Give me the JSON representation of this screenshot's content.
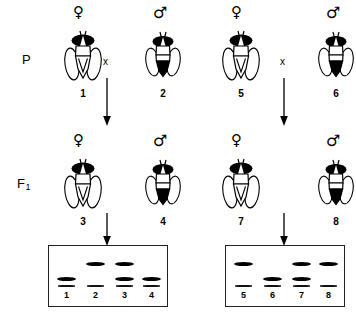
{
  "figure": {
    "type": "genetics-cross-diagram",
    "organism": "fruit fly"
  },
  "generations": [
    {
      "key": "P",
      "label": "P",
      "sub": ""
    },
    {
      "key": "F1",
      "label": "F",
      "sub": "1"
    }
  ],
  "cross_symbol": "x",
  "symbols": {
    "female": "♀",
    "male": "♂"
  },
  "crosses": [
    {
      "id": "cross-left",
      "parents": [
        {
          "number": "1",
          "sex": "female",
          "abdomen": "light"
        },
        {
          "number": "2",
          "sex": "male",
          "abdomen": "dark"
        }
      ],
      "offspring": [
        {
          "number": "3",
          "sex": "female",
          "abdomen": "light"
        },
        {
          "number": "4",
          "sex": "male",
          "abdomen": "dark"
        }
      ]
    },
    {
      "id": "cross-right",
      "parents": [
        {
          "number": "5",
          "sex": "female",
          "abdomen": "light"
        },
        {
          "number": "6",
          "sex": "male",
          "abdomen": "dark"
        }
      ],
      "offspring": [
        {
          "number": "7",
          "sex": "female",
          "abdomen": "light"
        },
        {
          "number": "8",
          "sex": "male",
          "abdomen": "dark"
        }
      ]
    }
  ],
  "gels": [
    {
      "id": "gel-left",
      "lanes": [
        {
          "label": "1",
          "bands": [
            {
              "position": "lower",
              "intensity": "strong"
            },
            {
              "position": "origin",
              "intensity": "faint"
            }
          ]
        },
        {
          "label": "2",
          "bands": [
            {
              "position": "upper",
              "intensity": "strong"
            },
            {
              "position": "origin",
              "intensity": "faint"
            }
          ]
        },
        {
          "label": "3",
          "bands": [
            {
              "position": "upper",
              "intensity": "strong"
            },
            {
              "position": "lower",
              "intensity": "strong"
            },
            {
              "position": "origin",
              "intensity": "faint"
            }
          ]
        },
        {
          "label": "4",
          "bands": [
            {
              "position": "lower",
              "intensity": "strong"
            },
            {
              "position": "origin",
              "intensity": "faint"
            }
          ]
        }
      ]
    },
    {
      "id": "gel-right",
      "lanes": [
        {
          "label": "5",
          "bands": [
            {
              "position": "upper",
              "intensity": "strong"
            },
            {
              "position": "origin",
              "intensity": "faint"
            }
          ]
        },
        {
          "label": "6",
          "bands": [
            {
              "position": "lower",
              "intensity": "strong"
            },
            {
              "position": "origin",
              "intensity": "faint"
            }
          ]
        },
        {
          "label": "7",
          "bands": [
            {
              "position": "upper",
              "intensity": "strong"
            },
            {
              "position": "lower",
              "intensity": "strong"
            },
            {
              "position": "origin",
              "intensity": "faint"
            }
          ]
        },
        {
          "label": "8",
          "bands": [
            {
              "position": "upper",
              "intensity": "strong"
            },
            {
              "position": "origin",
              "intensity": "faint"
            }
          ]
        }
      ]
    }
  ],
  "colors": {
    "ink": "#000000",
    "paper": "#ffffff",
    "gel_border": "#222222"
  }
}
